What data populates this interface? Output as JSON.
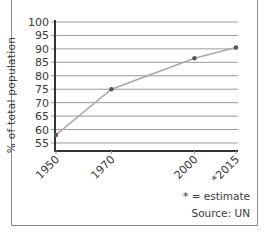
{
  "chart_data": {
    "type": "line",
    "title": "",
    "xlabel": "",
    "ylabel": "% of total population",
    "x": [
      "1950",
      "1970",
      "2000",
      "*2015"
    ],
    "x_numeric": [
      1950,
      1970,
      2000,
      2015
    ],
    "values": [
      58,
      75,
      86.5,
      90.5
    ],
    "series": [
      {
        "name": "% of total population",
        "values": [
          58,
          75,
          86.5,
          90.5
        ]
      }
    ],
    "ylim": [
      53,
      100
    ],
    "yticks": [
      55,
      60,
      65,
      70,
      75,
      80,
      85,
      90,
      95,
      100
    ],
    "grid": true,
    "legend": null,
    "annotations": [
      "* = estimate",
      "Source: UN"
    ]
  },
  "labels": {
    "ylabel": "% of total population",
    "estimate_note": "* = estimate",
    "source_note": "Source: UN"
  },
  "colors": {
    "line": "#a8a8a8",
    "marker": "#555555",
    "grid": "#9a9a9a",
    "axis": "#333333",
    "text": "#3a3a3a"
  }
}
